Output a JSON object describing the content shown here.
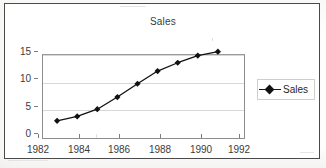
{
  "chart_data": {
    "type": "line",
    "title": "Sales",
    "xlabel": "",
    "ylabel": "",
    "x": [
      1983,
      1984,
      1985,
      1986,
      1987,
      1988,
      1989,
      1990,
      1991
    ],
    "values": [
      2.2,
      3.0,
      4.3,
      6.5,
      8.9,
      11.2,
      12.7,
      14.0,
      14.7
    ],
    "series": [
      {
        "name": "Sales",
        "values": [
          2.2,
          3.0,
          4.3,
          6.5,
          8.9,
          11.2,
          12.7,
          14.0,
          14.7
        ],
        "marker": "diamond",
        "color": "#111111"
      }
    ],
    "xlim": [
      1982,
      1992
    ],
    "ylim": [
      0,
      15
    ],
    "xticks": [
      1982,
      1984,
      1986,
      1988,
      1990,
      1992
    ],
    "xtick_labels": [
      "1982",
      "1984",
      "1986",
      "1988",
      "1990",
      "1992"
    ],
    "yticks": [
      0,
      5,
      10,
      15
    ],
    "ytick_labels": [
      "0",
      "5",
      "10",
      "15"
    ],
    "grid": "horizontal",
    "legend": {
      "position": "right",
      "entries": [
        "Sales"
      ]
    }
  },
  "colors": {
    "series": "#111111",
    "gridline": "#d8d8d6",
    "axis": "#8d8d8d",
    "frame": "#4a4a4a",
    "text": "#3b3b3b",
    "background": "#ffffff"
  }
}
